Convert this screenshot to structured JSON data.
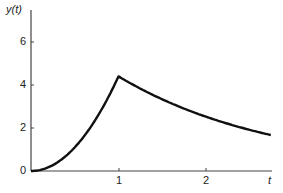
{
  "chart_data": {
    "type": "line",
    "title": "",
    "xlabel": "t",
    "ylabel": "y(t)",
    "xlim": [
      0,
      2.8
    ],
    "ylim": [
      0,
      7
    ],
    "x_ticks": [
      "1",
      "2"
    ],
    "y_ticks": [
      "0",
      "2",
      "4",
      "6"
    ],
    "grid": false,
    "legend": null,
    "series": [
      {
        "name": "y(t)",
        "description": "Rises from 0 to a peak of about 4.4 at t=1, then decays exponentially toward about 1.65 at t≈2.75",
        "x": [
          0,
          0.25,
          0.5,
          0.75,
          1.0,
          1.25,
          1.5,
          1.75,
          2.0,
          2.25,
          2.5,
          2.75
        ],
        "y": [
          0,
          0.28,
          1.1,
          2.5,
          4.4,
          3.83,
          3.33,
          2.9,
          2.52,
          2.19,
          1.91,
          1.66
        ]
      }
    ]
  },
  "labels": {
    "y_axis": "y(t)",
    "x_axis": "t",
    "y_tick_0": "0",
    "y_tick_2": "2",
    "y_tick_4": "4",
    "y_tick_6": "6",
    "x_tick_1": "1",
    "x_tick_2": "2"
  }
}
